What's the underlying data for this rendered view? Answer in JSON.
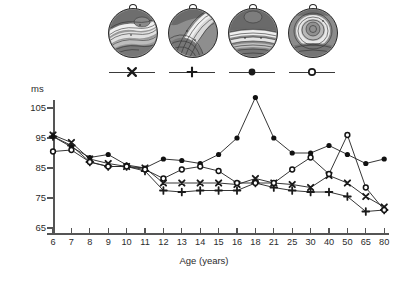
{
  "figure": {
    "y_axis_unit_label": "ms",
    "x_axis_title": "Age (years)"
  },
  "head_maps": [
    {
      "name": "topomap-1",
      "marker": "x"
    },
    {
      "name": "topomap-2",
      "marker": "plus"
    },
    {
      "name": "topomap-3",
      "marker": "filled-circle"
    },
    {
      "name": "topomap-4",
      "marker": "open-circle"
    }
  ],
  "legend": [
    {
      "marker": "x",
      "label": ""
    },
    {
      "marker": "plus",
      "label": ""
    },
    {
      "marker": "filled-circle",
      "label": ""
    },
    {
      "marker": "open-circle",
      "label": ""
    }
  ],
  "chart_data": {
    "type": "line",
    "title": "",
    "xlabel": "Age (years)",
    "ylabel": "ms",
    "ylim": [
      65,
      110
    ],
    "yticks": [
      65,
      75,
      85,
      95,
      105
    ],
    "grid": false,
    "legend_position": "top",
    "categories": [
      "6",
      "7",
      "8",
      "9",
      "10",
      "11",
      "12",
      "13",
      "14",
      "15",
      "16",
      "18",
      "21",
      "25",
      "30",
      "40",
      "50",
      "65",
      "80"
    ],
    "series": [
      {
        "name": "Component 1",
        "marker": "x",
        "values": [
          96.0,
          93.5,
          88.0,
          86.5,
          85.5,
          85.0,
          80.0,
          80.0,
          80.0,
          80.0,
          79.5,
          81.5,
          80.0,
          79.5,
          78.5,
          82.5,
          80.0,
          75.5,
          72.0
        ]
      },
      {
        "name": "Component 2",
        "marker": "plus",
        "values": [
          95.5,
          92.5,
          87.0,
          85.5,
          85.5,
          84.0,
          77.5,
          77.0,
          77.5,
          77.5,
          77.5,
          80.0,
          78.5,
          77.5,
          77.0,
          77.0,
          75.5,
          70.5,
          71.0
        ]
      },
      {
        "name": "Component 3",
        "marker": "filled-circle",
        "values": [
          95.5,
          92.0,
          88.5,
          89.5,
          86.0,
          85.0,
          88.0,
          87.5,
          86.5,
          89.5,
          95.0,
          108.5,
          95.0,
          90.0,
          90.0,
          92.5,
          89.5,
          86.5,
          88.0
        ]
      },
      {
        "name": "Component 4",
        "marker": "open-circle",
        "values": [
          90.5,
          91.0,
          87.0,
          85.5,
          85.5,
          84.5,
          81.5,
          84.5,
          85.5,
          84.0,
          80.0,
          80.0,
          80.0,
          84.5,
          88.5,
          83.0,
          96.0,
          78.5,
          71.0
        ]
      }
    ],
    "annotations": []
  }
}
